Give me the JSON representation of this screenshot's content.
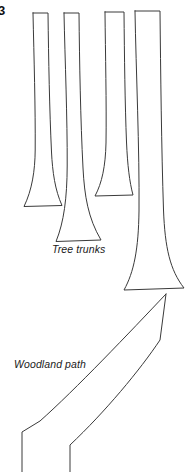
{
  "figure": {
    "number": "3",
    "background_color": "#ffffff",
    "stroke_color": "#3a3a3a",
    "text_color": "#1a1a1a",
    "width": 189,
    "height": 472,
    "style": "line-art-sketch"
  },
  "labels": {
    "tree_trunks": "Tree trunks",
    "woodland_path": "Woodland path"
  },
  "annotations": [
    {
      "name": "tree-trunks-label",
      "text": "Tree trunks",
      "x": 52,
      "y": 243
    },
    {
      "name": "woodland-path-label",
      "text": "Woodland path",
      "x": 14,
      "y": 358
    }
  ],
  "shapes": {
    "trunks": [
      {
        "name": "tree-trunk-1",
        "top_left_x": 33,
        "top_right_x": 48,
        "top_y": 13,
        "base_y": 206,
        "base_left_x": 24,
        "base_right_x": 62
      },
      {
        "name": "tree-trunk-2",
        "top_left_x": 64,
        "top_right_x": 79,
        "top_y": 13,
        "base_y": 241,
        "base_left_x": 56,
        "base_right_x": 101
      },
      {
        "name": "tree-trunk-3",
        "top_left_x": 105,
        "top_right_x": 124,
        "top_y": 12,
        "base_y": 196,
        "base_left_x": 95,
        "base_right_x": 133
      },
      {
        "name": "tree-trunk-4",
        "top_left_x": 135,
        "top_right_x": 160,
        "top_y": 11,
        "base_y": 289,
        "base_left_x": 124,
        "base_right_x": 184
      }
    ],
    "path": {
      "name": "woodland-path",
      "apex_x": 166,
      "apex_y": 294,
      "right_edge_x": 160,
      "bottom_left_x": 22,
      "bottom_left_y": 432
    }
  }
}
